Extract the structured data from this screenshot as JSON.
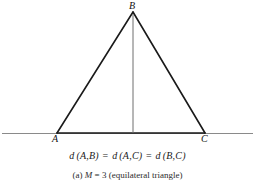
{
  "figure": {
    "vertices": {
      "apex_label": "B",
      "left_label": "A",
      "right_label": "C"
    },
    "equation": {
      "fn1": "d",
      "pair1": "(A,B)",
      "eq1": "=",
      "fn2": "d",
      "pair2": "(A,C)",
      "eq2": "=",
      "fn3": "d",
      "pair3": "(B,C)"
    },
    "caption": {
      "index": "(a)",
      "symbol": "M",
      "equals": "=",
      "value": "3",
      "description": "(equilateral triangle)"
    },
    "colors": {
      "ink": "#1a1a1a",
      "baseline": "#8a8a8a",
      "background": "#ffffff"
    }
  }
}
